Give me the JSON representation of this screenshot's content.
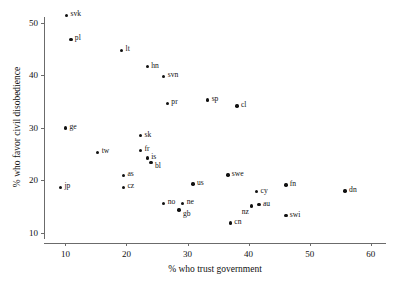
{
  "chart_data": {
    "type": "scatter",
    "title": "",
    "xlabel": "% who trust government",
    "ylabel": "% who favor civil disobedience",
    "xlim": [
      6.5,
      62.5
    ],
    "ylim": [
      8.0,
      52.5
    ],
    "xticks": [
      10,
      20,
      30,
      40,
      50,
      60
    ],
    "yticks": [
      10,
      20,
      30,
      40,
      50
    ],
    "grid": false,
    "legend": null,
    "points": [
      {
        "label": "svk",
        "x": 10.2,
        "y": 51.5,
        "lp": "lbl-right"
      },
      {
        "label": "pl",
        "x": 10.9,
        "y": 46.9,
        "lp": "lbl-right"
      },
      {
        "label": "lt",
        "x": 19.2,
        "y": 44.8,
        "lp": "lbl-right"
      },
      {
        "label": "hn",
        "x": 23.4,
        "y": 41.7,
        "lp": "lbl-right"
      },
      {
        "label": "svn",
        "x": 26.1,
        "y": 39.8,
        "lp": "lbl-right"
      },
      {
        "label": "pr",
        "x": 26.7,
        "y": 34.7,
        "lp": "lbl-right"
      },
      {
        "label": "sp",
        "x": 33.3,
        "y": 35.3,
        "lp": "lbl-right"
      },
      {
        "label": "cl",
        "x": 38.1,
        "y": 34.2,
        "lp": "lbl-right"
      },
      {
        "label": "ge",
        "x": 10.0,
        "y": 30.0,
        "lp": "lbl-right"
      },
      {
        "label": "sk",
        "x": 22.3,
        "y": 28.5,
        "lp": "lbl-right"
      },
      {
        "label": "tw",
        "x": 15.3,
        "y": 25.3,
        "lp": "lbl-right"
      },
      {
        "label": "fr",
        "x": 22.3,
        "y": 25.7,
        "lp": "lbl-right"
      },
      {
        "label": "is",
        "x": 23.4,
        "y": 24.2,
        "lp": "lbl-right"
      },
      {
        "label": "bl",
        "x": 24.0,
        "y": 23.4,
        "lp": "lbl-rightdown"
      },
      {
        "label": "as",
        "x": 19.5,
        "y": 20.9,
        "lp": "lbl-right"
      },
      {
        "label": "cz",
        "x": 19.5,
        "y": 18.6,
        "lp": "lbl-right"
      },
      {
        "label": "jp",
        "x": 9.2,
        "y": 18.6,
        "lp": "lbl-right"
      },
      {
        "label": "us",
        "x": 30.9,
        "y": 19.3,
        "lp": "lbl-right"
      },
      {
        "label": "swe",
        "x": 36.6,
        "y": 21.0,
        "lp": "lbl-right"
      },
      {
        "label": "cy",
        "x": 41.3,
        "y": 17.8,
        "lp": "lbl-right"
      },
      {
        "label": "fn",
        "x": 46.1,
        "y": 19.1,
        "lp": "lbl-right"
      },
      {
        "label": "dn",
        "x": 55.8,
        "y": 17.9,
        "lp": "lbl-right"
      },
      {
        "label": "no",
        "x": 26.1,
        "y": 15.6,
        "lp": "lbl-right"
      },
      {
        "label": "ne",
        "x": 29.2,
        "y": 15.6,
        "lp": "lbl-right"
      },
      {
        "label": "gb",
        "x": 28.6,
        "y": 14.3,
        "lp": "lbl-rightdown"
      },
      {
        "label": "nz",
        "x": 40.5,
        "y": 15.1,
        "lp": "lbl-belowleft"
      },
      {
        "label": "au",
        "x": 41.7,
        "y": 15.3,
        "lp": "lbl-right"
      },
      {
        "label": "cn",
        "x": 37.0,
        "y": 11.8,
        "lp": "lbl-right"
      },
      {
        "label": "swi",
        "x": 46.1,
        "y": 13.2,
        "lp": "lbl-right"
      }
    ]
  }
}
